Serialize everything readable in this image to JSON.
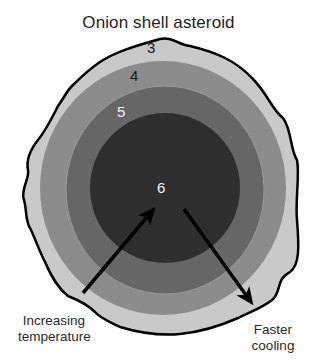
{
  "title": "Onion shell asteroid",
  "layers": [
    {
      "id": "3",
      "label": "3",
      "color": "#c9c9c9",
      "position": "outermost"
    },
    {
      "id": "4",
      "label": "4",
      "color": "#8c8c8c"
    },
    {
      "id": "5",
      "label": "5",
      "color": "#666666"
    },
    {
      "id": "6",
      "label": "6",
      "color": "#2e2e2e",
      "position": "core"
    }
  ],
  "outline_color": "#000000",
  "arrows": [
    {
      "label": "Increasing temperature",
      "direction": "toward-center"
    },
    {
      "label": "Faster cooling",
      "direction": "toward-surface"
    }
  ],
  "annotations": {
    "increasing_line1": "Increasing",
    "increasing_line2": "temperature",
    "faster_line1": "Faster",
    "faster_line2": "cooling"
  }
}
